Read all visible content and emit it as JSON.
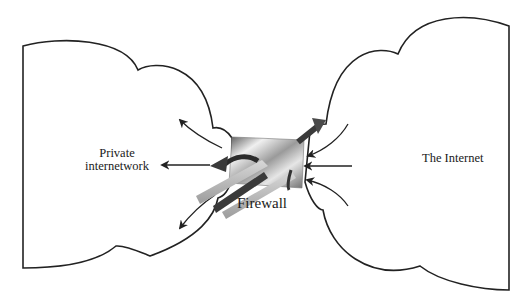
{
  "diagram": {
    "type": "network-firewall",
    "nodes": {
      "private": {
        "label_line1": "Private",
        "label_line2": "internetwork"
      },
      "internet": {
        "label": "The Internet"
      },
      "firewall": {
        "label": "Firewall"
      }
    },
    "edges": [
      {
        "from": "firewall",
        "to": "private",
        "count": 3,
        "direction": "outbound-to-private"
      },
      {
        "from": "internet",
        "to": "firewall",
        "count": 3,
        "direction": "inbound-to-firewall"
      }
    ],
    "colors": {
      "stroke": "#222222",
      "background": "#ffffff",
      "firewall_light": "#e8e8e8",
      "firewall_dark": "#6a6a6a",
      "arrow_dark": "#2b2b2b"
    }
  }
}
